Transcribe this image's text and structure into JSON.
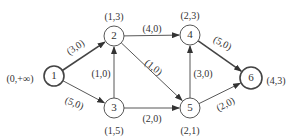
{
  "diagram": {
    "type": "directed-graph",
    "colors": {
      "stroke": "#444444",
      "text": "#333333",
      "background": "#ffffff"
    },
    "nodes": [
      {
        "id": "1",
        "label": "1",
        "x": 54,
        "y": 76,
        "r": 10,
        "bold": true,
        "annotation": "(0,+∞)",
        "ann_x": 20,
        "ann_y": 80
      },
      {
        "id": "2",
        "label": "2",
        "x": 114,
        "y": 36,
        "r": 10,
        "bold": false,
        "annotation": "(1,3)",
        "ann_x": 114,
        "ann_y": 18
      },
      {
        "id": "3",
        "label": "3",
        "x": 114,
        "y": 108,
        "r": 10,
        "bold": false,
        "annotation": "(1,5)",
        "ann_x": 114,
        "ann_y": 132
      },
      {
        "id": "4",
        "label": "4",
        "x": 190,
        "y": 35,
        "r": 10,
        "bold": false,
        "annotation": "(2,3)",
        "ann_x": 190,
        "ann_y": 17
      },
      {
        "id": "5",
        "label": "5",
        "x": 190,
        "y": 108,
        "r": 10,
        "bold": false,
        "annotation": "(2,1)",
        "ann_x": 190,
        "ann_y": 132
      },
      {
        "id": "6",
        "label": "6",
        "x": 251,
        "y": 78,
        "r": 11,
        "bold": true,
        "annotation": "(4,3)",
        "ann_x": 276,
        "ann_y": 82
      }
    ],
    "edges": [
      {
        "from": "1",
        "to": "2",
        "label": "(3,0)",
        "lx": 76,
        "ly": 48,
        "rot": -33,
        "bold": true
      },
      {
        "from": "1",
        "to": "3",
        "label": "(5,0)",
        "lx": 74,
        "ly": 104,
        "rot": 22,
        "bold": false
      },
      {
        "from": "2",
        "to": "4",
        "label": "(4,0)",
        "lx": 152,
        "ly": 30,
        "rot": 0,
        "bold": false
      },
      {
        "from": "3",
        "to": "2",
        "label": "(1,0)",
        "lx": 101,
        "ly": 75,
        "rot": 0,
        "bold": false
      },
      {
        "from": "2",
        "to": "5",
        "label": "(1,0)",
        "lx": 153,
        "ly": 68,
        "rot": 38,
        "bold": false
      },
      {
        "from": "3",
        "to": "5",
        "label": "(2,0)",
        "lx": 152,
        "ly": 120,
        "rot": 0,
        "bold": false
      },
      {
        "from": "5",
        "to": "4",
        "label": "(3,0)",
        "lx": 203,
        "ly": 75,
        "rot": 0,
        "bold": false
      },
      {
        "from": "4",
        "to": "6",
        "label": "(5,0)",
        "lx": 222,
        "ly": 44,
        "rot": 28,
        "bold": true
      },
      {
        "from": "5",
        "to": "6",
        "label": "(2,0)",
        "lx": 226,
        "ly": 105,
        "rot": -28,
        "bold": false
      }
    ]
  }
}
